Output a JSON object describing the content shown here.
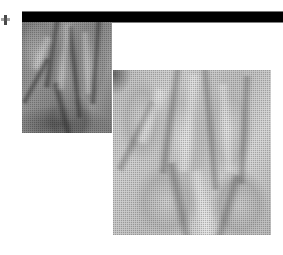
{
  "page": {
    "background_color": "#ffffff",
    "width": 283,
    "height": 255
  },
  "header_bar": {
    "name": "black-rule",
    "color": "#000000",
    "description": "Solid black horizontal rule spanning the top of the page"
  },
  "edge_mark": {
    "name": "binding-mark",
    "color": "#2a2a2a",
    "description": "Small dark scan artifact at the left page edge"
  },
  "figures": [
    {
      "id": "photo-hand-dark",
      "label": "Close-up photograph of fingers, darker exposure",
      "tone": "dark",
      "base_color": "#8d8d8d",
      "position": "upper-left"
    },
    {
      "id": "photo-hand-light",
      "label": "Close-up photograph of fingers, lighter exposure",
      "tone": "light",
      "base_color": "#c9c9c9",
      "position": "lower-right overlapping"
    }
  ]
}
